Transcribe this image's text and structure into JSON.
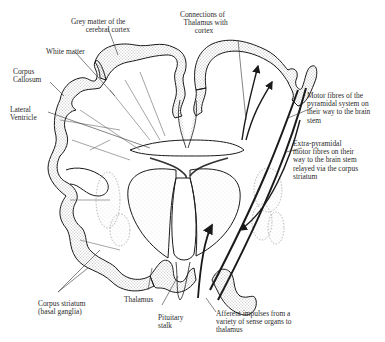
{
  "figure": {
    "labels": {
      "grey_matter": "Grey matter of the\n        cerebral cortex",
      "white_matter": "White matter",
      "corpus_callosum": "Corpus\nCallosum",
      "lateral_ventricle": "Lateral\nVentricle",
      "connections_thalamus": "Connections of\n  Thalamus with\n        cortex",
      "motor_fibres": "Motor fibres of the\npyramidal system on\ntheir way to the brain\nstem",
      "extra_pyramidal": "Extra-pyramidal\nmotor fibres on their\nway to the brain stem\nrelayed via the corpus\nstriatum",
      "corpus_striatum": "Corpus striatum\n(basal ganglia)",
      "thalamus": "Thalamus",
      "pituitary": "Pituitary\nstalk",
      "afferent": "Afferent impulses from a\nvariety of sense organs to\nthalamus"
    },
    "colors": {
      "ink": "#1a1a1a",
      "stipple": "#555555",
      "background": "#ffffff"
    }
  }
}
